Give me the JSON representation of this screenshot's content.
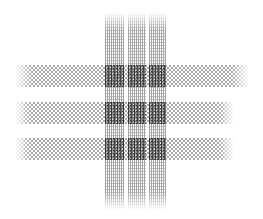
{
  "figure": {
    "title": "",
    "background_color": "#ffffff",
    "width": 263,
    "height": 219
  },
  "palette": {
    "background": "#ffffff",
    "band_ink": "#9a9a9a",
    "stripe_ink": "#8e8e8e",
    "stripe_ink_alt": "#b4b4b4",
    "intersection_ink": "#4a4a4a"
  },
  "pattern": {
    "horizontal_bands": [
      {
        "id": "band-h-1",
        "label": "Top horizontal band",
        "x": 15,
        "y": 65,
        "width": 234,
        "height": 22
      },
      {
        "id": "band-h-2",
        "label": "Middle horizontal band",
        "x": 15,
        "y": 102,
        "width": 219,
        "height": 22
      },
      {
        "id": "band-h-3",
        "label": "Bottom horizontal band",
        "x": 15,
        "y": 138,
        "width": 219,
        "height": 22
      }
    ],
    "vertical_stripes": [
      {
        "id": "band-v-1",
        "label": "Left vertical stripe",
        "x": 105,
        "y": 12,
        "width": 19,
        "height": 198
      },
      {
        "id": "band-v-2",
        "label": "Center vertical stripe",
        "x": 128,
        "y": 12,
        "width": 18,
        "height": 198
      },
      {
        "id": "band-v-3",
        "label": "Right vertical stripe",
        "x": 149,
        "y": 12,
        "width": 17,
        "height": 198
      }
    ],
    "intersections": [
      {
        "id": "knot-1-1",
        "label": "Intersection row 1 column 1",
        "x": 105,
        "y": 65,
        "width": 19,
        "height": 22
      },
      {
        "id": "knot-1-2",
        "label": "Intersection row 1 column 2",
        "x": 128,
        "y": 65,
        "width": 18,
        "height": 22
      },
      {
        "id": "knot-1-3",
        "label": "Intersection row 1 column 3",
        "x": 149,
        "y": 65,
        "width": 17,
        "height": 22
      },
      {
        "id": "knot-2-1",
        "label": "Intersection row 2 column 1",
        "x": 105,
        "y": 102,
        "width": 19,
        "height": 22
      },
      {
        "id": "knot-2-2",
        "label": "Intersection row 2 column 2",
        "x": 128,
        "y": 102,
        "width": 18,
        "height": 22
      },
      {
        "id": "knot-2-3",
        "label": "Intersection row 2 column 3",
        "x": 149,
        "y": 102,
        "width": 17,
        "height": 22
      },
      {
        "id": "knot-3-1",
        "label": "Intersection row 3 column 1",
        "x": 105,
        "y": 138,
        "width": 19,
        "height": 22
      },
      {
        "id": "knot-3-2",
        "label": "Intersection row 3 column 2",
        "x": 128,
        "y": 138,
        "width": 18,
        "height": 22
      },
      {
        "id": "knot-3-3",
        "label": "Intersection row 3 column 3",
        "x": 149,
        "y": 138,
        "width": 17,
        "height": 22
      }
    ]
  }
}
